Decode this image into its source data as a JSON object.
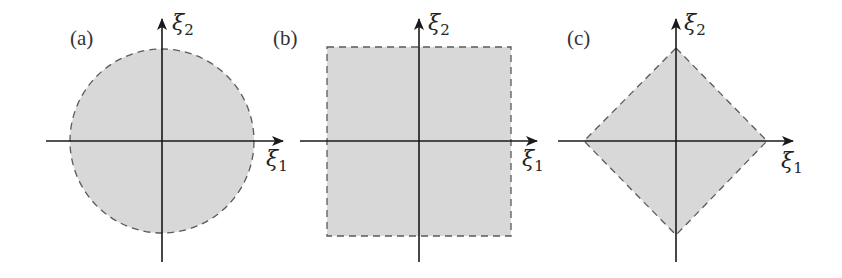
{
  "figure": {
    "style": {
      "fill_color": "#d8d8d8",
      "border_color": "#5a5a5a",
      "axis_color": "#1a1a1a",
      "dash_pattern": "7 5"
    },
    "panels": [
      {
        "id": "a",
        "label": "(a)",
        "shape": "circle",
        "x_axis_label": "ξ",
        "x_axis_sub": "1",
        "y_axis_label": "ξ",
        "y_axis_sub": "2"
      },
      {
        "id": "b",
        "label": "(b)",
        "shape": "square",
        "x_axis_label": "ξ",
        "x_axis_sub": "1",
        "y_axis_label": "ξ",
        "y_axis_sub": "2"
      },
      {
        "id": "c",
        "label": "(c)",
        "shape": "diamond",
        "x_axis_label": "ξ",
        "x_axis_sub": "1",
        "y_axis_label": "ξ",
        "y_axis_sub": "2"
      }
    ]
  }
}
